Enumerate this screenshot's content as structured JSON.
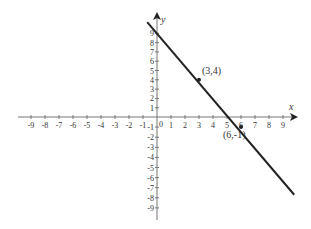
{
  "chart_data": {
    "type": "line",
    "title": "",
    "xlabel": "x",
    "ylabel": "y",
    "xlim": [
      -9,
      9
    ],
    "ylim": [
      -9,
      9
    ],
    "grid": false,
    "x_ticks": [
      -9,
      -8,
      -7,
      -6,
      -5,
      -4,
      -3,
      -2,
      -1,
      1,
      2,
      3,
      4,
      5,
      6,
      7,
      8,
      9
    ],
    "y_ticks": [
      -9,
      -8,
      -7,
      -6,
      -5,
      -4,
      -3,
      -2,
      -1,
      1,
      2,
      3,
      4,
      5,
      6,
      7,
      8,
      9
    ],
    "origin_label": "0",
    "series": [
      {
        "name": "line",
        "equation": "y = -5/3 x + 9",
        "x": [
          -0.7,
          9.8
        ],
        "y": [
          10.2,
          -7.7
        ],
        "color": "#222222"
      }
    ],
    "points": [
      {
        "x": 3,
        "y": 4,
        "label": "(3,4)"
      },
      {
        "x": 6,
        "y": -1,
        "label": "(6,-1)"
      }
    ]
  }
}
